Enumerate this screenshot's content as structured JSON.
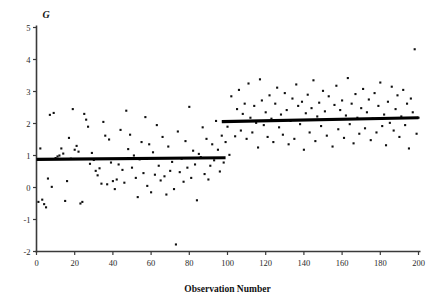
{
  "chart_data": {
    "type": "scatter",
    "title": "",
    "xlabel": "Observation Number",
    "ylabel": "G",
    "xlim": [
      0,
      200
    ],
    "ylim": [
      -2,
      5
    ],
    "xticks": [
      0,
      20,
      40,
      60,
      80,
      100,
      120,
      140,
      160,
      180,
      200
    ],
    "xtick_labels": [
      "0",
      "20",
      "40",
      "60",
      "80",
      "100",
      "120",
      "140",
      "160",
      "180",
      "200"
    ],
    "yticks": [
      -2,
      -1,
      0,
      1,
      2,
      3,
      4,
      5
    ],
    "ytick_labels": [
      "-2",
      "-1",
      "0",
      "1",
      "2",
      "3",
      "4",
      "5"
    ],
    "grid": false,
    "legend": null,
    "marker": {
      "shape": "square",
      "size": 2.1,
      "color": "#101010"
    },
    "series": [
      {
        "name": "observations",
        "x": [
          1,
          2,
          3,
          4,
          5,
          6,
          7,
          8,
          9,
          10,
          11,
          12,
          13,
          14,
          15,
          16,
          17,
          18,
          19,
          20,
          21,
          22,
          23,
          24,
          25,
          26,
          27,
          28,
          29,
          30,
          31,
          32,
          33,
          34,
          35,
          36,
          37,
          38,
          39,
          40,
          41,
          42,
          43,
          44,
          45,
          46,
          47,
          48,
          49,
          50,
          51,
          52,
          53,
          54,
          55,
          56,
          57,
          58,
          59,
          60,
          61,
          62,
          63,
          64,
          65,
          66,
          67,
          68,
          69,
          70,
          71,
          72,
          73,
          74,
          75,
          76,
          77,
          78,
          79,
          80,
          81,
          82,
          83,
          84,
          85,
          86,
          87,
          88,
          89,
          90,
          91,
          92,
          93,
          94,
          95,
          96,
          97,
          98,
          99,
          100,
          101,
          102,
          103,
          104,
          105,
          106,
          107,
          108,
          109,
          110,
          111,
          112,
          113,
          114,
          115,
          116,
          117,
          118,
          119,
          120,
          121,
          122,
          123,
          124,
          125,
          126,
          127,
          128,
          129,
          130,
          131,
          132,
          133,
          134,
          135,
          136,
          137,
          138,
          139,
          140,
          141,
          142,
          143,
          144,
          145,
          146,
          147,
          148,
          149,
          150,
          151,
          152,
          153,
          154,
          155,
          156,
          157,
          158,
          159,
          160,
          161,
          162,
          163,
          164,
          165,
          166,
          167,
          168,
          169,
          170,
          171,
          172,
          173,
          174,
          175,
          176,
          177,
          178,
          179,
          180,
          181,
          182,
          183,
          184,
          185,
          186,
          187,
          188,
          189,
          190,
          191,
          192,
          193,
          194,
          195,
          196,
          197,
          198,
          199,
          200
        ],
        "y": [
          -0.45,
          1.22,
          -0.38,
          -0.52,
          -0.62,
          0.28,
          2.27,
          0.02,
          2.33,
          0.92,
          0.97,
          1.0,
          1.22,
          1.06,
          -0.42,
          0.2,
          1.55,
          0.9,
          2.45,
          1.18,
          1.3,
          1.12,
          -0.5,
          -0.45,
          2.3,
          2.12,
          1.9,
          0.74,
          1.08,
          0.86,
          0.52,
          0.38,
          0.6,
          0.12,
          2.05,
          1.62,
          0.1,
          1.5,
          0.78,
          0.2,
          -0.05,
          0.25,
          0.72,
          1.8,
          0.55,
          0.15,
          2.4,
          1.2,
          1.65,
          0.62,
          1.0,
          0.3,
          -0.3,
          0.88,
          1.42,
          0.45,
          2.2,
          0.05,
          1.35,
          -0.15,
          1.1,
          0.4,
          1.95,
          0.68,
          0.22,
          1.58,
          0.35,
          -0.22,
          1.28,
          0.52,
          0.8,
          -0.05,
          -1.78,
          1.75,
          0.48,
          0.9,
          0.18,
          1.45,
          0.62,
          2.52,
          0.3,
          1.15,
          0.72,
          -0.4,
          1.05,
          0.95,
          1.88,
          0.42,
          1.52,
          0.25,
          0.68,
          1.35,
          0.85,
          2.08,
          1.18,
          0.5,
          1.62,
          0.78,
          1.42,
          1.9,
          1.02,
          2.85,
          2.05,
          1.6,
          2.45,
          3.05,
          1.78,
          2.3,
          2.62,
          1.52,
          3.25,
          2.18,
          1.72,
          2.55,
          2.02,
          1.25,
          3.38,
          2.72,
          1.95,
          2.35,
          1.58,
          2.88,
          2.15,
          1.42,
          2.62,
          3.12,
          1.88,
          2.28,
          1.65,
          2.95,
          2.42,
          1.35,
          2.08,
          2.78,
          1.52,
          3.22,
          2.55,
          1.98,
          2.68,
          1.18,
          2.32,
          2.9,
          1.72,
          2.48,
          3.35,
          1.45,
          2.22,
          2.65,
          1.92,
          3.02,
          2.38,
          1.62,
          2.85,
          2.12,
          1.28,
          2.58,
          3.18,
          1.82,
          2.42,
          2.72,
          1.55,
          2.25,
          3.42,
          1.98,
          2.62,
          1.38,
          2.92,
          2.18,
          1.68,
          2.48,
          3.08,
          1.85,
          2.35,
          2.75,
          1.48,
          2.15,
          2.95,
          1.72,
          2.55,
          3.28,
          1.92,
          2.28,
          1.32,
          2.68,
          2.02,
          3.15,
          1.78,
          2.45,
          2.88,
          1.58,
          2.22,
          3.05,
          1.95,
          2.62,
          1.22,
          2.78,
          2.35,
          4.32,
          1.68,
          2.18
        ]
      }
    ],
    "fitted_steps": [
      {
        "name": "segment-1",
        "x_start": 0,
        "x_end": 99,
        "y_start": 0.88,
        "y_end": 0.93
      },
      {
        "name": "segment-2",
        "x_start": 97,
        "x_end": 200,
        "y_start": 2.06,
        "y_end": 2.18
      }
    ]
  }
}
